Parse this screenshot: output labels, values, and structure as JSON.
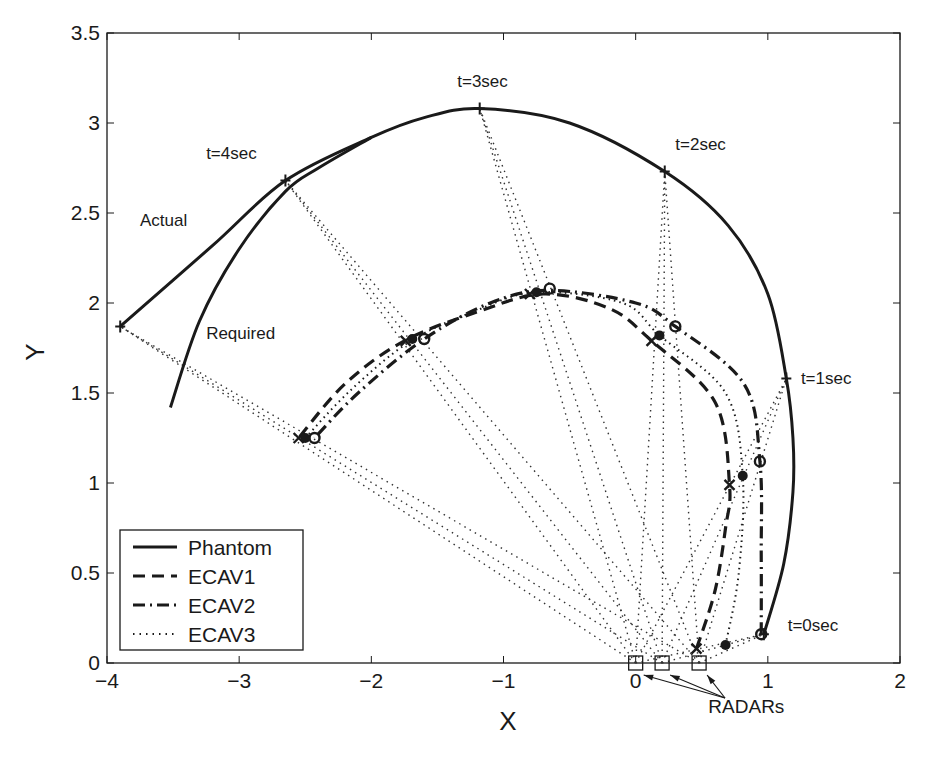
{
  "chart_data": {
    "type": "line",
    "title": "",
    "xlabel": "X",
    "ylabel": "Y",
    "xlim": [
      -4,
      2
    ],
    "ylim": [
      0,
      3.5
    ],
    "xticks": [
      -4,
      -3,
      -2,
      -1,
      0,
      1,
      2
    ],
    "yticks": [
      0,
      0.5,
      1,
      1.5,
      2,
      2.5,
      3,
      3.5
    ],
    "xtick_labels": [
      "−4",
      "−3",
      "−2",
      "−1",
      "0",
      "1",
      "2"
    ],
    "ytick_labels": [
      "0",
      "0.5",
      "1",
      "1.5",
      "2",
      "2.5",
      "3",
      "3.5"
    ],
    "grid": false,
    "legend_position": "lower left",
    "series": [
      {
        "name": "Phantom",
        "style": "solid",
        "label": "Actual",
        "points": [
          [
            0.97,
            0.16
          ],
          [
            1.12,
            0.55
          ],
          [
            1.19,
            0.95
          ],
          [
            1.19,
            1.25
          ],
          [
            1.14,
            1.58
          ],
          [
            1.0,
            2.05
          ],
          [
            0.7,
            2.43
          ],
          [
            0.22,
            2.73
          ],
          [
            -0.5,
            3.0
          ],
          [
            -1.18,
            3.08
          ],
          [
            -1.6,
            3.03
          ],
          [
            -2.0,
            2.92
          ],
          [
            -2.65,
            2.68
          ],
          [
            -3.2,
            2.32
          ],
          [
            -3.9,
            1.87
          ]
        ]
      },
      {
        "name": "Required",
        "style": "solid",
        "label": "Required",
        "points": [
          [
            -2.0,
            2.92
          ],
          [
            -2.4,
            2.75
          ],
          [
            -2.65,
            2.62
          ],
          [
            -3.0,
            2.3
          ],
          [
            -3.3,
            1.9
          ],
          [
            -3.52,
            1.42
          ]
        ]
      },
      {
        "name": "ECAV1",
        "style": "dashed",
        "marker": "x",
        "points": [
          [
            0.46,
            0.08
          ],
          [
            0.6,
            0.4
          ],
          [
            0.68,
            0.75
          ],
          [
            0.71,
            0.99
          ],
          [
            0.6,
            1.45
          ],
          [
            0.12,
            1.79
          ],
          [
            -0.2,
            1.97
          ],
          [
            -0.7,
            2.05
          ],
          [
            -1.2,
            1.95
          ],
          [
            -1.75,
            1.79
          ],
          [
            -2.2,
            1.55
          ],
          [
            -2.55,
            1.25
          ]
        ]
      },
      {
        "name": "ECAV2",
        "style": "dashdot",
        "marker": "o",
        "points": [
          [
            0.95,
            0.16
          ],
          [
            0.95,
            0.6
          ],
          [
            0.94,
            1.12
          ],
          [
            0.82,
            1.55
          ],
          [
            0.3,
            1.87
          ],
          [
            0.0,
            2.0
          ],
          [
            -0.65,
            2.07
          ],
          [
            -1.1,
            2.0
          ],
          [
            -1.6,
            1.8
          ],
          [
            -2.1,
            1.5
          ],
          [
            -2.43,
            1.25
          ]
        ]
      },
      {
        "name": "ECAV3",
        "style": "dotted",
        "marker": "dot",
        "points": [
          [
            0.68,
            0.1
          ],
          [
            0.78,
            0.5
          ],
          [
            0.81,
            1.04
          ],
          [
            0.68,
            1.5
          ],
          [
            0.18,
            1.82
          ],
          [
            -0.1,
            2.0
          ],
          [
            -0.75,
            2.06
          ],
          [
            -1.2,
            1.96
          ],
          [
            -1.7,
            1.79
          ],
          [
            -2.15,
            1.52
          ],
          [
            -2.5,
            1.25
          ]
        ]
      }
    ],
    "time_markers": [
      {
        "label": "t=0sec",
        "phantom": [
          0.97,
          0.16
        ],
        "ecav1": [
          0.46,
          0.08
        ],
        "ecav2": [
          0.95,
          0.16
        ],
        "ecav3": [
          0.68,
          0.1
        ]
      },
      {
        "label": "t=1sec",
        "phantom": [
          1.14,
          1.58
        ],
        "ecav1": [
          0.71,
          0.99
        ],
        "ecav2": [
          0.94,
          1.12
        ],
        "ecav3": [
          0.81,
          1.04
        ]
      },
      {
        "label": "t=2sec",
        "phantom": [
          0.22,
          2.73
        ],
        "ecav1": [
          0.12,
          1.79
        ],
        "ecav2": [
          0.3,
          1.87
        ],
        "ecav3": [
          0.18,
          1.82
        ]
      },
      {
        "label": "t=3sec",
        "phantom": [
          -1.18,
          3.08
        ],
        "ecav1": [
          -0.8,
          2.05
        ],
        "ecav2": [
          -0.65,
          2.08
        ],
        "ecav3": [
          -0.75,
          2.06
        ]
      },
      {
        "label": "t=4sec",
        "phantom": [
          -2.65,
          2.68
        ],
        "ecav1": [
          -1.74,
          1.79
        ],
        "ecav2": [
          -1.6,
          1.8
        ],
        "ecav3": [
          -1.69,
          1.8
        ]
      },
      {
        "label": "",
        "phantom": [
          -3.9,
          1.87
        ],
        "ecav1": [
          -2.55,
          1.25
        ],
        "ecav2": [
          -2.43,
          1.25
        ],
        "ecav3": [
          -2.5,
          1.25
        ]
      }
    ],
    "radars": [
      [
        0.0,
        0.0
      ],
      [
        0.2,
        0.0
      ],
      [
        0.48,
        0.0
      ]
    ],
    "annotations": [
      {
        "text": "t=0sec",
        "x": 1.15,
        "y": 0.18
      },
      {
        "text": "t=1sec",
        "x": 1.25,
        "y": 1.55
      },
      {
        "text": "t=2sec",
        "x": 0.3,
        "y": 2.85
      },
      {
        "text": "t=3sec",
        "x": -1.35,
        "y": 3.2
      },
      {
        "text": "t=4sec",
        "x": -3.25,
        "y": 2.8
      },
      {
        "text": "Actual",
        "x": -3.75,
        "y": 2.43
      },
      {
        "text": "Required",
        "x": -3.25,
        "y": 1.8
      },
      {
        "text": "RADARs",
        "x": 0.55,
        "y": -0.28
      }
    ]
  },
  "legend": {
    "items": [
      {
        "label": "Phantom",
        "style": "solid"
      },
      {
        "label": "ECAV1",
        "style": "dashed"
      },
      {
        "label": "ECAV2",
        "style": "dashdot"
      },
      {
        "label": "ECAV3",
        "style": "dotted"
      }
    ]
  },
  "axes": {
    "xlabel": "X",
    "ylabel": "Y",
    "radar_label": "RADARs"
  },
  "colors": {
    "ink": "#1a1a1a",
    "dotted": "#333333",
    "background": "#ffffff"
  }
}
